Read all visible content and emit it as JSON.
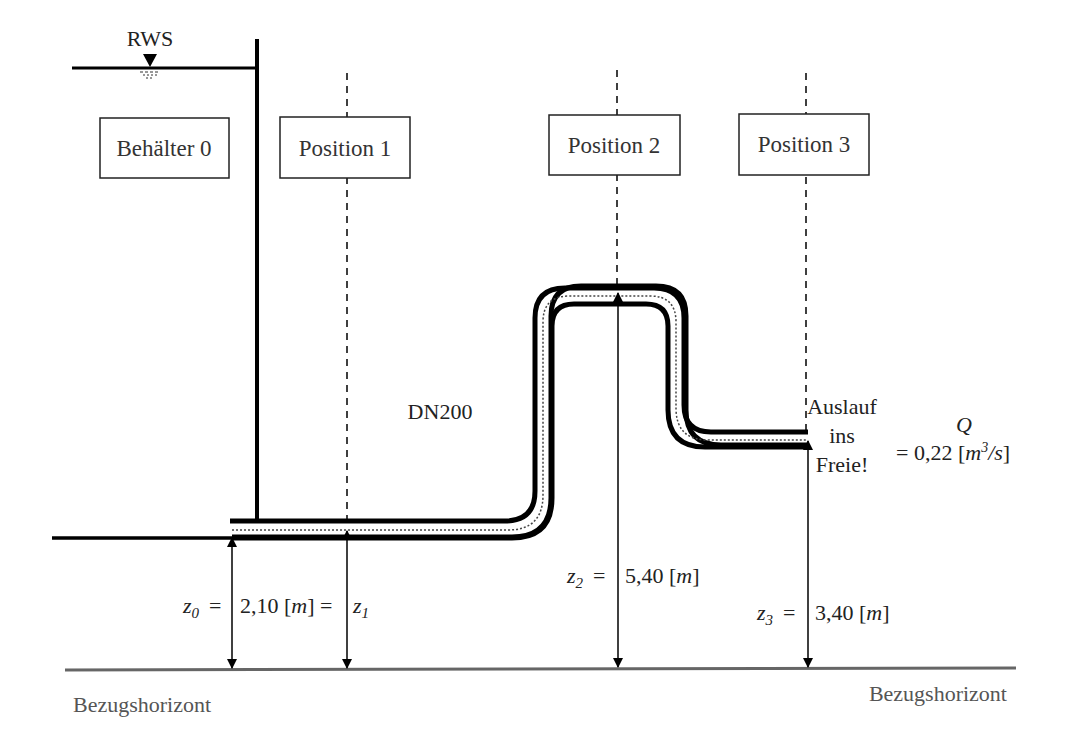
{
  "reservoir": {
    "water_level_label": "RWS",
    "container_label": "Behälter 0"
  },
  "positions": [
    {
      "label": "Position 1"
    },
    {
      "label": "Position 2"
    },
    {
      "label": "Position 3"
    }
  ],
  "pipe": {
    "label": "DN200"
  },
  "outlet": {
    "line1": "Auslauf",
    "line2": "ins",
    "line3": "Freie!"
  },
  "flow": {
    "symbol": "Q",
    "value": "= 0,22 [",
    "unit_m": "m",
    "unit_exp": "3",
    "unit_rest": "/s",
    "close": "]"
  },
  "heights": {
    "z0_symbol": "z",
    "z0_sub": "0",
    "z0_eq": "=",
    "z01_value": "2,10 [",
    "z01_unit": "m",
    "z01_close": "] =",
    "z1_symbol": "z",
    "z1_sub": "1",
    "z2_symbol": "z",
    "z2_sub": "2",
    "z2_eq": "=",
    "z2_value": "5,40 [",
    "z2_unit": "m",
    "z2_close": "]",
    "z3_symbol": "z",
    "z3_sub": "3",
    "z3_eq": "=",
    "z3_value": "3,40 [",
    "z3_unit": "m",
    "z3_close": "]"
  },
  "datum": {
    "left_label": "Bezugshorizont",
    "right_label": "Bezugshorizont"
  }
}
